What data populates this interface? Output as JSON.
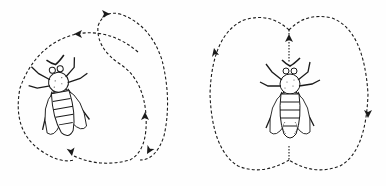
{
  "figure": {
    "panels": [
      {
        "id": "round-dance",
        "description": "Bee with circular dashed path looping around, arrows showing direction"
      },
      {
        "id": "waggle-dance",
        "description": "Bee in center with figure-eight (two-lobed) dashed path, central straight run through bee"
      }
    ],
    "colors": {
      "ink": "#1a1a1a",
      "background": "#fefefe"
    }
  }
}
